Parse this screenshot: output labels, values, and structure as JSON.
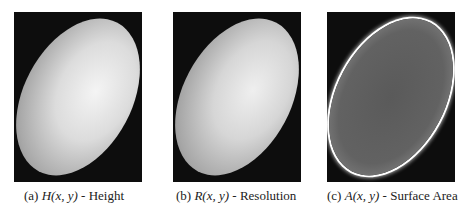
{
  "figure": {
    "subfigures": [
      {
        "label": "(a)",
        "math": "H(x, y)",
        "sep": " - ",
        "name": "Height"
      },
      {
        "label": "(b)",
        "math": "R(x, y)",
        "sep": " - ",
        "name": "Resolution"
      },
      {
        "label": "(c)",
        "math": "A(x, y)",
        "sep": " - ",
        "name": "Surface Area"
      }
    ]
  }
}
